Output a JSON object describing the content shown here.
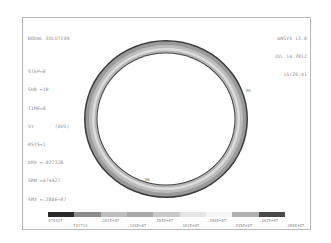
{
  "plot": {
    "title": "NODAL SOLUTION",
    "info": {
      "step": "STEP=8",
      "sub": "SUB =10",
      "time": "TIME=8",
      "item": "SY       (AVG)",
      "rsys": "RSYS=1",
      "dmx": "DMX =.027328",
      "smn": "SMN =474427",
      "smx": "SMX =.288E+07"
    },
    "software": "ANSYS 13.0",
    "date": "JUL 14 2012",
    "time_of_day": "15:26:41",
    "max_label": "MX",
    "min_label": "MN"
  },
  "legend": {
    "colors": [
      "#2a2a2a",
      "#8c8c8c",
      "#bdbdbd",
      "#a8a8a8",
      "#c9c9c9",
      "#e6e6e6",
      "#f5f5f5",
      "#b0b0b0",
      "#4a4a4a"
    ],
    "top_labels": [
      "474427",
      ".101E+07",
      ".155E+07",
      ".208E+07",
      ".262E+07"
    ],
    "bottom_labels": [
      "741713",
      ".128E+07",
      ".182E+07",
      ".235E+07",
      ".288E+07"
    ]
  },
  "colors": {
    "outer_edge": "#3c3c3c",
    "ring_band_outer": "#9a9a9a",
    "ring_band_mid": "#d4d4d4",
    "ring_band_inner": "#b2b2b2",
    "inner_edge": "#444444"
  }
}
